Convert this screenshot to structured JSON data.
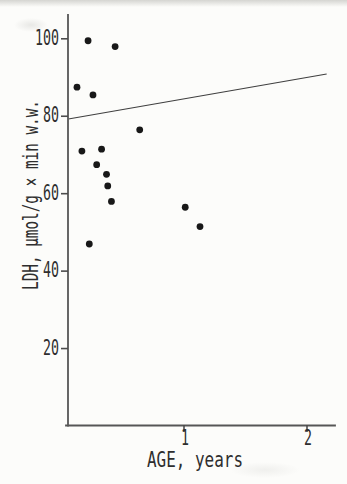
{
  "figure": {
    "kind": "scanned-journal-figure",
    "background_color": "#fcfcfa",
    "ink_color": "#2e2e2e",
    "axis_color": "#565656",
    "marker_color": "#181818"
  },
  "chart_data": {
    "type": "scatter",
    "title": "",
    "xlabel": "AGE, years",
    "ylabel": "LDH, μmol/g × min w.w.",
    "x_ticks": [
      1,
      2
    ],
    "y_ticks": [
      20,
      40,
      60,
      80,
      100
    ],
    "xlim": [
      0,
      2.3
    ],
    "ylim": [
      0,
      106
    ],
    "grid": false,
    "legend": null,
    "marker": {
      "shape": "filled-circle",
      "radius_px": 3.4,
      "color": "#181818"
    },
    "columns": [
      "age_years",
      "ldh_umol_per_g_min_ww"
    ],
    "points": [
      [
        0.22,
        99.5
      ],
      [
        0.44,
        98.0
      ],
      [
        0.13,
        87.5
      ],
      [
        0.26,
        85.5
      ],
      [
        0.64,
        76.5
      ],
      [
        0.33,
        71.5
      ],
      [
        0.17,
        71.0
      ],
      [
        0.29,
        67.5
      ],
      [
        0.37,
        65.0
      ],
      [
        0.38,
        62.0
      ],
      [
        0.41,
        58.0
      ],
      [
        1.01,
        56.5
      ],
      [
        1.13,
        51.5
      ],
      [
        0.23,
        47.0
      ]
    ],
    "trend_line": {
      "x1": 0.06,
      "y1": 79.3,
      "x2": 2.16,
      "y2": 90.9
    }
  }
}
